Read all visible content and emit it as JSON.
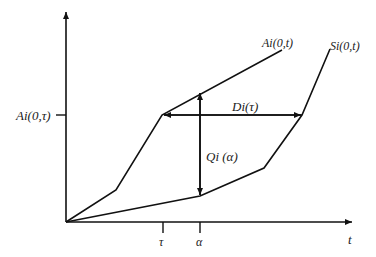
{
  "diagram": {
    "type": "cumulative arrival/service curves",
    "axes": {
      "x_label": "t",
      "y_tick_label": "Ai(0,τ)",
      "x_ticks": [
        "τ",
        "α"
      ]
    },
    "curves": [
      {
        "name": "arrival",
        "label": "Ai(0,t)"
      },
      {
        "name": "service",
        "label": "Si(0,t)"
      }
    ],
    "annotations": {
      "delay": "Di(τ)",
      "backlog": "Qi (α)"
    }
  }
}
